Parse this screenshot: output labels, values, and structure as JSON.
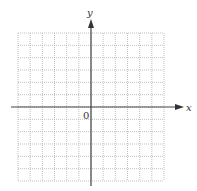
{
  "diagram": {
    "type": "coordinate-grid",
    "grid": {
      "columns": 12,
      "rows": 12,
      "line_style": "dotted",
      "line_color": "#b0b0b0"
    },
    "axes": {
      "x_label": "x",
      "y_label": "y",
      "origin_label": "0",
      "axis_color": "#444444"
    }
  }
}
